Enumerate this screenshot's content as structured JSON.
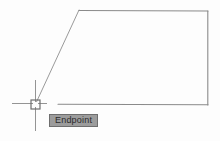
{
  "app": {
    "name": "cad-drawing-viewport",
    "background_color": "#fdfdfd"
  },
  "drawing": {
    "name": "quadrilateral-outline",
    "stroke_color": "#8c8c8c",
    "stroke_width": 1,
    "vertices": [
      {
        "label": "lower-left",
        "x": 36,
        "y": 104
      },
      {
        "label": "upper-left",
        "x": 79,
        "y": 10
      },
      {
        "label": "upper-right",
        "x": 208,
        "y": 11
      },
      {
        "label": "lower-right",
        "x": 208,
        "y": 105
      }
    ],
    "segments": [
      {
        "name": "left-diagonal-edge",
        "x1": 36,
        "y1": 103,
        "x2": 79,
        "y2": 10
      },
      {
        "name": "top-edge",
        "x1": 79,
        "y1": 10,
        "x2": 208,
        "y2": 11
      },
      {
        "name": "right-edge",
        "x1": 208,
        "y1": 11,
        "x2": 208,
        "y2": 105
      },
      {
        "name": "bottom-edge",
        "x1": 58,
        "y1": 104,
        "x2": 208,
        "y2": 105
      }
    ]
  },
  "cursor": {
    "name": "crosshair-cursor",
    "center_x": 35,
    "center_y": 104,
    "color": "#8a8a8a",
    "horizontal_extent": {
      "x1": 12,
      "x2": 47
    },
    "vertical_extent": {
      "y1": 80,
      "y2": 131
    },
    "snap_marker": {
      "name": "endpoint-snap-square",
      "shape": "square",
      "size": 9,
      "color": "#7a7a7a"
    }
  },
  "tooltip": {
    "name": "osnap-tooltip",
    "label": "Endpoint",
    "background_color": "#9c9c9c",
    "border_color": "#6e6e6e",
    "text_color": "#2b2b2b",
    "x": 49,
    "y": 114,
    "width": 47,
    "height": 13
  }
}
